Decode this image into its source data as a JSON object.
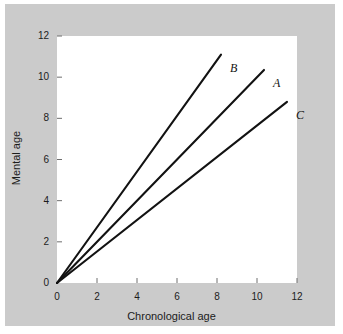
{
  "chart_data": {
    "type": "line",
    "title": "",
    "subtitle": "",
    "xlabel": "Chronological age",
    "ylabel": "Mental age",
    "xlim": [
      0,
      12
    ],
    "ylim": [
      0,
      12
    ],
    "xticks": [
      0,
      2,
      4,
      6,
      8,
      10,
      12
    ],
    "yticks": [
      0,
      2,
      4,
      6,
      8,
      10,
      12
    ],
    "xtick_labels": [
      "0",
      "2",
      "4",
      "6",
      "8",
      "10",
      "12"
    ],
    "ytick_labels": [
      "0",
      "2",
      "4",
      "6",
      "8",
      "10",
      "12"
    ],
    "grid": false,
    "legend": "none",
    "annotations": [
      "B",
      "A",
      "C"
    ],
    "series": [
      {
        "name": "B",
        "label": "B",
        "slope": 1.35,
        "x": [
          0,
          8.2
        ],
        "values": [
          0,
          11.1
        ],
        "label_x": 8.65,
        "label_y": 10.75
      },
      {
        "name": "A",
        "label": "A",
        "slope": 1.0,
        "x": [
          0,
          10.35
        ],
        "values": [
          0,
          10.35
        ],
        "label_x": 10.8,
        "label_y": 10.0
      },
      {
        "name": "C",
        "label": "C",
        "slope": 0.765,
        "x": [
          0,
          11.5
        ],
        "values": [
          0,
          8.8
        ],
        "label_x": 11.95,
        "label_y": 8.45
      }
    ]
  },
  "colors": {
    "page_background": "#ffffff",
    "mat_background": "#cbcbcb",
    "panel_background": "#ffffff",
    "line_color": "#121212",
    "tick_color": "#6e6e6e",
    "text_color": "#1c1c1c"
  }
}
